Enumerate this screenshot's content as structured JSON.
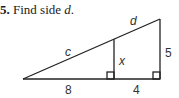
{
  "problem": {
    "number": "5.",
    "prompt_prefix": "Find side ",
    "prompt_var": "d",
    "prompt_suffix": "."
  },
  "diagram": {
    "labels": {
      "c": "c",
      "d": "d",
      "x": "x",
      "right_side": "5",
      "base_left": "8",
      "base_right": "4"
    },
    "line_color": "#222222"
  }
}
